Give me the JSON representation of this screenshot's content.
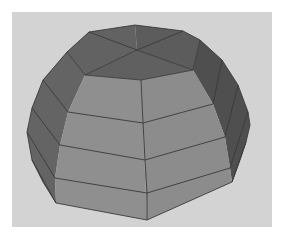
{
  "scene": {
    "subject": "low-poly 3D dome mesh",
    "colors": {
      "frame": "#ffffff",
      "background": "#d3d3d3",
      "front_faces": "#8e8e8e",
      "top_faces": "#606060",
      "left_faces": "#646464",
      "right_faces": "#4f4f4f",
      "edges": "#3a3a3a"
    },
    "polygons": {
      "top_cap_left": "89,32 135,25 137,50 85,75 67,52",
      "top_cap_right": "135,25 183,31 200,40 193,70 137,50",
      "top_cap_front": "85,75 137,50 193,70 141,80",
      "left_band": "67,52 85,75 68,112 60,145 55,178 56,203 43,182 32,160 27,132 32,108 43,80",
      "right_band": "200,40 222,60 238,85 248,112 250,125 246,142 240,160 232,182 230,168 225,137 213,104 193,70",
      "front_left": "85,75 141,80 147,220 56,203 55,178 60,145 68,112",
      "front_right": "141,80 193,70 213,104 225,137 230,168 232,182 147,220"
    },
    "edges": [
      "89,32 137,50 193,70",
      "183,31 137,50 85,75",
      "67,52 85,75",
      "43,80 68,112",
      "32,108 60,145",
      "27,132 55,178",
      "32,160 56,203",
      "200,40 193,70",
      "222,60 213,104",
      "238,85 225,137",
      "248,112 230,168",
      "246,142 232,182",
      "85,75 141,80 193,70",
      "68,112 143,123 213,104",
      "60,145 145,160 225,137",
      "55,178 147,193 230,168",
      "141,80 143,123 145,160 147,193 147,220"
    ]
  }
}
